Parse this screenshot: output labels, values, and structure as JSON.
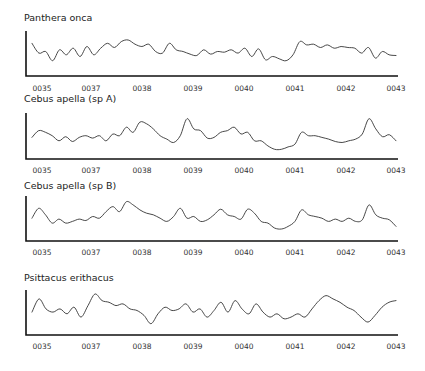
{
  "chart_data": {
    "type": "line",
    "layout": "four stacked line panels sharing x-axis tick labels",
    "x_tick_labels": [
      "0035",
      "0037",
      "0038",
      "0039",
      "0040",
      "0041",
      "0042",
      "0043"
    ],
    "y_ticks": "none shown",
    "grid": false,
    "legend": false,
    "panels": [
      {
        "title": "Panthera onca",
        "series": [
          {
            "name": "Panthera onca",
            "values": [
              0.75,
              0.45,
              0.5,
              0.22,
              0.55,
              0.4,
              0.6,
              0.35,
              0.65,
              0.4,
              0.6,
              0.75,
              0.62,
              0.8,
              0.85,
              0.72,
              0.65,
              0.72,
              0.5,
              0.45,
              0.75,
              0.55,
              0.5,
              0.42,
              0.38,
              0.55,
              0.42,
              0.5,
              0.48,
              0.55,
              0.45,
              0.6,
              0.35,
              0.58,
              0.25,
              0.35,
              0.28,
              0.22,
              0.4,
              0.8,
              0.7,
              0.72,
              0.62,
              0.7,
              0.6,
              0.65,
              0.62,
              0.6,
              0.45,
              0.62,
              0.3,
              0.5,
              0.4,
              0.38
            ]
          }
        ]
      },
      {
        "title": "Cebus apella (sp A)",
        "series": [
          {
            "name": "Cebus apella (sp A)",
            "values": [
              0.4,
              0.6,
              0.55,
              0.45,
              0.3,
              0.42,
              0.28,
              0.4,
              0.45,
              0.38,
              0.45,
              0.3,
              0.5,
              0.45,
              0.7,
              0.55,
              0.85,
              0.8,
              0.65,
              0.45,
              0.35,
              0.25,
              0.45,
              0.95,
              0.65,
              0.6,
              0.38,
              0.4,
              0.55,
              0.6,
              0.7,
              0.5,
              0.55,
              0.3,
              0.3,
              0.15,
              0.05,
              0.05,
              0.12,
              0.2,
              0.55,
              0.45,
              0.45,
              0.4,
              0.35,
              0.28,
              0.25,
              0.3,
              0.35,
              0.5,
              0.95,
              0.65,
              0.42,
              0.48,
              0.3
            ]
          }
        ]
      },
      {
        "title": "Cebus apella (sp B)",
        "series": [
          {
            "name": "Cebus apella (sp B)",
            "values": [
              0.45,
              0.75,
              0.55,
              0.3,
              0.42,
              0.3,
              0.35,
              0.42,
              0.38,
              0.5,
              0.45,
              0.65,
              0.8,
              0.65,
              0.95,
              0.85,
              0.7,
              0.6,
              0.55,
              0.45,
              0.35,
              0.5,
              0.75,
              0.45,
              0.5,
              0.35,
              0.4,
              0.55,
              0.72,
              0.55,
              0.5,
              0.42,
              0.72,
              0.6,
              0.35,
              0.3,
              0.15,
              0.12,
              0.2,
              0.35,
              0.7,
              0.55,
              0.5,
              0.45,
              0.35,
              0.42,
              0.35,
              0.45,
              0.35,
              0.4,
              0.85,
              0.55,
              0.45,
              0.4,
              0.2
            ]
          }
        ]
      },
      {
        "title": "Psittacus erithacus",
        "series": [
          {
            "name": "Psittacus erithacus",
            "values": [
              0.45,
              0.85,
              0.55,
              0.45,
              0.55,
              0.4,
              0.6,
              0.3,
              0.65,
              1.0,
              0.8,
              0.75,
              0.65,
              0.7,
              0.55,
              0.5,
              0.35,
              0.1,
              0.4,
              0.6,
              0.5,
              0.55,
              0.7,
              0.45,
              0.55,
              0.3,
              0.5,
              0.75,
              0.45,
              0.8,
              0.55,
              0.4,
              0.7,
              0.45,
              0.3,
              0.4,
              0.25,
              0.3,
              0.4,
              0.3,
              0.55,
              0.8,
              0.95,
              0.85,
              0.75,
              0.6,
              0.5,
              0.3,
              0.15,
              0.35,
              0.6,
              0.75,
              0.8
            ]
          }
        ]
      }
    ]
  },
  "panels": [
    {
      "title": "Panthera onca"
    },
    {
      "title": "Cebus apella (sp A)"
    },
    {
      "title": "Cebus apella (sp B)"
    },
    {
      "title": "Psittacus erithacus"
    }
  ],
  "ticks": [
    "0035",
    "0037",
    "0038",
    "0039",
    "0040",
    "0041",
    "0042",
    "0043"
  ]
}
